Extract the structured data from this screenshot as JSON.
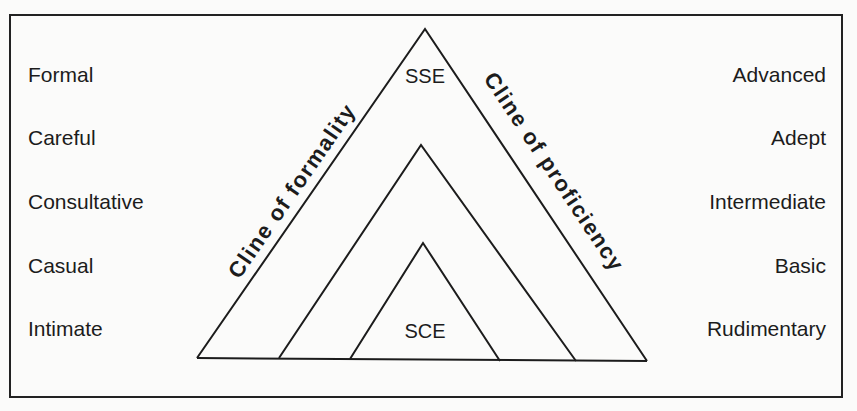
{
  "diagram": {
    "type": "nested-triangle",
    "formality_levels": [
      "Formal",
      "Careful",
      "Consultative",
      "Casual",
      "Intimate"
    ],
    "proficiency_levels": [
      "Advanced",
      "Adept",
      "Intermediate",
      "Basic",
      "Rudimentary"
    ],
    "apex_label": "SSE",
    "inner_label": "SCE",
    "left_axis_label": "Cline of formality",
    "right_axis_label": "Cline of proficiency",
    "colors": {
      "line": "#1c1c1c",
      "background": "#fbfbfa"
    }
  }
}
